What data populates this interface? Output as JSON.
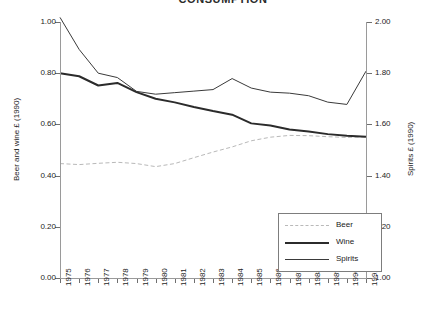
{
  "chart_data": {
    "type": "line",
    "title": "CONSUMPTION",
    "x": [
      1975,
      1976,
      1977,
      1978,
      1979,
      1980,
      1981,
      1982,
      1983,
      1984,
      1985,
      1986,
      1987,
      1988,
      1989,
      1990,
      1991
    ],
    "xticklabels": [
      "1975",
      "1976",
      "1977",
      "1978",
      "1979",
      "1980",
      "1981",
      "1982",
      "1983",
      "1984",
      "1985",
      "1986",
      "1987",
      "1988",
      "1989",
      "1990",
      "1991"
    ],
    "xlabel": "",
    "ylabel": "Beer and wine £ (1990)",
    "y2label": "Spirits £ (1990)",
    "ylim": [
      0.0,
      1.0
    ],
    "yticks": [
      0.0,
      0.2,
      0.4,
      0.6,
      0.8,
      1.0
    ],
    "yticklabels": [
      "0.00",
      "0.20",
      "0.40",
      "0.60",
      "0.80",
      "1.00"
    ],
    "y2lim": [
      1.0,
      2.0
    ],
    "y2ticks": [
      1.0,
      1.2,
      1.4,
      1.6,
      1.8,
      2.0
    ],
    "y2ticklabels": [
      "1.00",
      "1.20",
      "1.40",
      "1.60",
      "1.80",
      "2.00"
    ],
    "grid": false,
    "legend_position": "lower right",
    "series": [
      {
        "name": "Beer",
        "axis": "left",
        "style": "dashed",
        "color": "#b9b9b9",
        "width": 1,
        "values": [
          0.447,
          0.443,
          0.448,
          0.452,
          0.447,
          0.435,
          0.447,
          0.47,
          0.492,
          0.512,
          0.536,
          0.55,
          0.557,
          0.556,
          0.552,
          0.549,
          0.551
        ]
      },
      {
        "name": "Wine",
        "axis": "left",
        "style": "solid",
        "color": "#2b2b2b",
        "width": 2,
        "values": [
          0.8,
          0.788,
          0.752,
          0.762,
          0.726,
          0.7,
          0.686,
          0.668,
          0.652,
          0.638,
          0.604,
          0.596,
          0.58,
          0.572,
          0.562,
          0.556,
          0.552
        ]
      },
      {
        "name": "Spirits",
        "axis": "right",
        "style": "solid",
        "color": "#3a3a3a",
        "width": 1,
        "values": [
          1.018,
          0.893,
          0.8,
          0.783,
          0.729,
          0.718,
          0.724,
          0.73,
          0.736,
          0.779,
          0.742,
          0.726,
          0.722,
          0.712,
          0.687,
          0.678,
          0.808
        ]
      }
    ],
    "legend": [
      {
        "label": "Beer"
      },
      {
        "label": "Wine"
      },
      {
        "label": "Spirits"
      }
    ]
  },
  "plot": {
    "left": 60,
    "right": 366,
    "top": 22,
    "bottom": 278,
    "legend_box": {
      "x": 278,
      "y": 213,
      "w": 102,
      "h": 57
    }
  }
}
